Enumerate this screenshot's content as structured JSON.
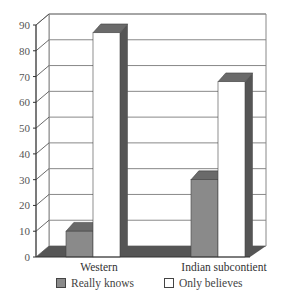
{
  "chart_data": {
    "type": "bar",
    "title": "",
    "xlabel": "",
    "ylabel": "",
    "categories": [
      "Western",
      "Indian subcontient"
    ],
    "series": [
      {
        "name": "Really knows",
        "values": [
          10,
          30
        ],
        "color": "#8a8a8a"
      },
      {
        "name": "Only believes",
        "values": [
          87,
          68
        ],
        "color": "#ffffff"
      }
    ],
    "ylim": [
      0,
      90
    ],
    "yticks": [
      0,
      10,
      20,
      30,
      40,
      50,
      60,
      70,
      80,
      90
    ],
    "grid": true,
    "style": "3d",
    "legend_position": "bottom"
  },
  "legend": {
    "items": [
      {
        "label": "Really knows",
        "color": "#8a8a8a"
      },
      {
        "label": "Only believes",
        "color": "#ffffff"
      }
    ]
  },
  "colors": {
    "bar_side": "#555555",
    "bar_top": "#6a6a6a",
    "floor": "#555555",
    "grid": "#888888"
  }
}
